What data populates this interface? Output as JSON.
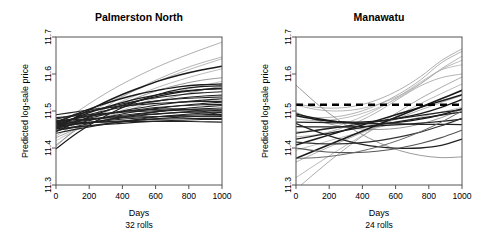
{
  "figure": {
    "kind": "two-panel-spaghetti-plot",
    "width": 479,
    "height": 245,
    "background": "#ffffff"
  },
  "chart_data": [
    {
      "type": "line",
      "panel_index": 0,
      "title": "Palmerston North",
      "xlabel": "Days",
      "sublabel": "32 rolls",
      "ylabel": "Predicted log-sale price",
      "xlim": [
        0,
        1000
      ],
      "ylim": [
        11.3,
        11.7
      ],
      "xticks": [
        0,
        200,
        400,
        600,
        800,
        1000
      ],
      "xticklabels": [
        "0",
        "200",
        "400",
        "600",
        "800",
        "1000"
      ],
      "yticks": [
        11.3,
        11.4,
        11.5,
        11.6,
        11.7
      ],
      "yticklabels": [
        "11.3",
        "11.4",
        "11.5",
        "11.6",
        "11.7"
      ],
      "grid": false,
      "legend": "none",
      "n_series": 32,
      "reference_line": null,
      "x": [
        0,
        125,
        250,
        375,
        500,
        625,
        750,
        875,
        1000
      ],
      "series": [
        {
          "name": "roll-01",
          "color": "#9a9a9a",
          "width": 0.8,
          "values": [
            11.455,
            11.497,
            11.534,
            11.567,
            11.596,
            11.622,
            11.645,
            11.666,
            11.686
          ]
        },
        {
          "name": "roll-02",
          "color": "#a5a5a5",
          "width": 0.8,
          "values": [
            11.447,
            11.479,
            11.508,
            11.535,
            11.56,
            11.583,
            11.604,
            11.623,
            11.641
          ]
        },
        {
          "name": "roll-03",
          "color": "#9f9f9f",
          "width": 0.8,
          "values": [
            11.404,
            11.454,
            11.496,
            11.532,
            11.562,
            11.588,
            11.611,
            11.63,
            11.646
          ]
        },
        {
          "name": "roll-04",
          "color": "#aaaaaa",
          "width": 0.8,
          "values": [
            11.432,
            11.466,
            11.496,
            11.522,
            11.545,
            11.566,
            11.584,
            11.6,
            11.614
          ]
        },
        {
          "name": "roll-05",
          "color": "#7d7d7d",
          "width": 0.8,
          "values": [
            11.408,
            11.45,
            11.485,
            11.514,
            11.538,
            11.557,
            11.572,
            11.583,
            11.59
          ]
        },
        {
          "name": "roll-06",
          "color": "#b4b4b4",
          "width": 0.8,
          "values": [
            11.42,
            11.449,
            11.475,
            11.498,
            11.519,
            11.538,
            11.554,
            11.568,
            11.58
          ]
        },
        {
          "name": "roll-07",
          "color": "#8f8f8f",
          "width": 0.8,
          "values": [
            11.428,
            11.452,
            11.474,
            11.494,
            11.512,
            11.528,
            11.543,
            11.556,
            11.567
          ]
        },
        {
          "name": "roll-08",
          "color": "#1a1a1a",
          "width": 1.5,
          "values": [
            11.452,
            11.485,
            11.514,
            11.54,
            11.562,
            11.582,
            11.598,
            11.611,
            11.621
          ]
        },
        {
          "name": "roll-09",
          "color": "#1a1a1a",
          "width": 1.4,
          "values": [
            11.468,
            11.492,
            11.513,
            11.531,
            11.546,
            11.557,
            11.566,
            11.571,
            11.573
          ]
        },
        {
          "name": "roll-10",
          "color": "#1a1a1a",
          "width": 1.3,
          "values": [
            11.46,
            11.483,
            11.503,
            11.52,
            11.534,
            11.545,
            11.553,
            11.558,
            11.56
          ]
        },
        {
          "name": "roll-11",
          "color": "#1a1a1a",
          "width": 1.3,
          "values": [
            11.444,
            11.47,
            11.492,
            11.512,
            11.528,
            11.541,
            11.551,
            11.558,
            11.562
          ]
        },
        {
          "name": "roll-12",
          "color": "#1a1a1a",
          "width": 1.2,
          "values": [
            11.398,
            11.44,
            11.475,
            11.504,
            11.528,
            11.546,
            11.559,
            11.566,
            11.568
          ]
        },
        {
          "name": "roll-13",
          "color": "#222222",
          "width": 1.1,
          "values": [
            11.472,
            11.489,
            11.504,
            11.517,
            11.528,
            11.537,
            11.544,
            11.549,
            11.552
          ]
        },
        {
          "name": "roll-14",
          "color": "#222222",
          "width": 1.1,
          "values": [
            11.466,
            11.482,
            11.496,
            11.508,
            11.519,
            11.528,
            11.535,
            11.54,
            11.543
          ]
        },
        {
          "name": "roll-15",
          "color": "#222222",
          "width": 1.1,
          "values": [
            11.478,
            11.491,
            11.503,
            11.513,
            11.521,
            11.528,
            11.533,
            11.536,
            11.538
          ]
        },
        {
          "name": "roll-16",
          "color": "#222222",
          "width": 1.1,
          "values": [
            11.458,
            11.473,
            11.486,
            11.498,
            11.508,
            11.517,
            11.524,
            11.529,
            11.533
          ]
        },
        {
          "name": "roll-17",
          "color": "#222222",
          "width": 1.1,
          "values": [
            11.49,
            11.498,
            11.506,
            11.512,
            11.517,
            11.521,
            11.524,
            11.526,
            11.526
          ]
        },
        {
          "name": "roll-18",
          "color": "#222222",
          "width": 1.1,
          "values": [
            11.452,
            11.466,
            11.479,
            11.49,
            11.5,
            11.508,
            11.515,
            11.52,
            11.524
          ]
        },
        {
          "name": "roll-19",
          "color": "#222222",
          "width": 1.1,
          "values": [
            11.47,
            11.48,
            11.489,
            11.497,
            11.504,
            11.51,
            11.514,
            11.517,
            11.518
          ]
        },
        {
          "name": "roll-20",
          "color": "#222222",
          "width": 1.1,
          "values": [
            11.446,
            11.459,
            11.471,
            11.482,
            11.491,
            11.499,
            11.506,
            11.511,
            11.515
          ]
        },
        {
          "name": "roll-21",
          "color": "#222222",
          "width": 1.1,
          "values": [
            11.462,
            11.471,
            11.479,
            11.487,
            11.493,
            11.499,
            11.503,
            11.506,
            11.508
          ]
        },
        {
          "name": "roll-22",
          "color": "#222222",
          "width": 1.1,
          "values": [
            11.482,
            11.487,
            11.492,
            11.496,
            11.499,
            11.501,
            11.503,
            11.503,
            11.503
          ]
        },
        {
          "name": "roll-23",
          "color": "#222222",
          "width": 1.1,
          "values": [
            11.455,
            11.464,
            11.473,
            11.48,
            11.487,
            11.492,
            11.497,
            11.5,
            11.502
          ]
        },
        {
          "name": "roll-24",
          "color": "#222222",
          "width": 1.1,
          "values": [
            11.468,
            11.474,
            11.48,
            11.485,
            11.489,
            11.493,
            11.496,
            11.497,
            11.498
          ]
        },
        {
          "name": "roll-25",
          "color": "#222222",
          "width": 1.1,
          "values": [
            11.44,
            11.451,
            11.461,
            11.47,
            11.478,
            11.485,
            11.49,
            11.494,
            11.496
          ]
        },
        {
          "name": "roll-26",
          "color": "#222222",
          "width": 1.1,
          "values": [
            11.458,
            11.465,
            11.471,
            11.477,
            11.481,
            11.485,
            11.488,
            11.49,
            11.491
          ]
        },
        {
          "name": "roll-27",
          "color": "#222222",
          "width": 1.1,
          "values": [
            11.474,
            11.477,
            11.48,
            11.482,
            11.484,
            11.485,
            11.486,
            11.486,
            11.485
          ]
        },
        {
          "name": "roll-28",
          "color": "#222222",
          "width": 1.1,
          "values": [
            11.448,
            11.456,
            11.463,
            11.47,
            11.475,
            11.48,
            11.483,
            11.486,
            11.487
          ]
        },
        {
          "name": "roll-29",
          "color": "#222222",
          "width": 1.1,
          "values": [
            11.462,
            11.466,
            11.47,
            11.473,
            11.476,
            11.478,
            11.479,
            11.48,
            11.48
          ]
        },
        {
          "name": "roll-30",
          "color": "#222222",
          "width": 1.1,
          "values": [
            11.452,
            11.457,
            11.462,
            11.466,
            11.47,
            11.473,
            11.475,
            11.477,
            11.477
          ]
        },
        {
          "name": "roll-31",
          "color": "#222222",
          "width": 1.2,
          "values": [
            11.466,
            11.468,
            11.47,
            11.471,
            11.472,
            11.472,
            11.472,
            11.471,
            11.47
          ]
        },
        {
          "name": "roll-32",
          "color": "#222222",
          "width": 1.2,
          "values": [
            11.47,
            11.481,
            11.49,
            11.497,
            11.502,
            11.505,
            11.505,
            11.5,
            11.488
          ]
        }
      ]
    },
    {
      "type": "line",
      "panel_index": 1,
      "title": "Manawatu",
      "xlabel": "Days",
      "sublabel": "24 rolls",
      "ylabel": "Predicted log-sale price",
      "xlim": [
        0,
        1000
      ],
      "ylim": [
        11.3,
        11.7
      ],
      "xticks": [
        0,
        200,
        400,
        600,
        800,
        1000
      ],
      "xticklabels": [
        "0",
        "200",
        "400",
        "600",
        "800",
        "1000"
      ],
      "yticks": [
        11.3,
        11.4,
        11.5,
        11.6,
        11.7
      ],
      "yticklabels": [
        "11.3",
        "11.4",
        "11.5",
        "11.6",
        "11.7"
      ],
      "grid": false,
      "legend": "none",
      "n_series": 24,
      "reference_line": {
        "name": "overall-mean",
        "value": 11.517,
        "style": "dashed",
        "color": "#000000",
        "width": 2.6
      },
      "x": [
        0,
        125,
        250,
        375,
        500,
        625,
        750,
        875,
        1000
      ],
      "series": [
        {
          "name": "roll-01",
          "color": "#9a9a9a",
          "width": 0.8,
          "values": [
            11.52,
            11.51,
            11.508,
            11.515,
            11.532,
            11.558,
            11.593,
            11.636,
            11.668
          ]
        },
        {
          "name": "roll-02",
          "color": "#a3a3a3",
          "width": 0.8,
          "values": [
            11.516,
            11.504,
            11.5,
            11.505,
            11.519,
            11.542,
            11.574,
            11.614,
            11.648
          ]
        },
        {
          "name": "roll-03",
          "color": "#9e9e9e",
          "width": 0.8,
          "values": [
            11.488,
            11.482,
            11.485,
            11.497,
            11.518,
            11.547,
            11.584,
            11.63,
            11.661
          ]
        },
        {
          "name": "roll-04",
          "color": "#ababab",
          "width": 0.8,
          "values": [
            11.478,
            11.474,
            11.478,
            11.49,
            11.51,
            11.538,
            11.573,
            11.612,
            11.637
          ]
        },
        {
          "name": "roll-05",
          "color": "#b0b0b0",
          "width": 0.8,
          "values": [
            11.444,
            11.448,
            11.46,
            11.48,
            11.507,
            11.541,
            11.578,
            11.611,
            11.625
          ]
        },
        {
          "name": "roll-06",
          "color": "#a0a0a0",
          "width": 0.8,
          "values": [
            11.43,
            11.436,
            11.45,
            11.471,
            11.5,
            11.535,
            11.568,
            11.59,
            11.6
          ]
        },
        {
          "name": "roll-07",
          "color": "#969696",
          "width": 0.8,
          "values": [
            11.288,
            11.336,
            11.382,
            11.424,
            11.464,
            11.5,
            11.534,
            11.564,
            11.592
          ]
        },
        {
          "name": "roll-08",
          "color": "#a8a8a8",
          "width": 0.8,
          "values": [
            11.32,
            11.357,
            11.393,
            11.427,
            11.459,
            11.49,
            11.52,
            11.547,
            11.573
          ]
        },
        {
          "name": "roll-09",
          "color": "#9c9c9c",
          "width": 0.8,
          "values": [
            11.362,
            11.388,
            11.413,
            11.437,
            11.46,
            11.482,
            11.503,
            11.523,
            11.542
          ]
        },
        {
          "name": "roll-10",
          "color": "#b2b2b2",
          "width": 0.8,
          "values": [
            11.394,
            11.41,
            11.426,
            11.441,
            11.456,
            11.47,
            11.484,
            11.497,
            11.51
          ]
        },
        {
          "name": "roll-11",
          "color": "#8a8a8a",
          "width": 0.9,
          "values": [
            11.496,
            11.475,
            11.46,
            11.452,
            11.45,
            11.454,
            11.465,
            11.482,
            11.505
          ]
        },
        {
          "name": "roll-12",
          "color": "#8f8f8f",
          "width": 0.9,
          "values": [
            11.57,
            11.52,
            11.477,
            11.442,
            11.414,
            11.393,
            11.38,
            11.374,
            11.376
          ]
        },
        {
          "name": "roll-13",
          "color": "#1a1a1a",
          "width": 1.6,
          "values": [
            11.372,
            11.395,
            11.418,
            11.441,
            11.464,
            11.487,
            11.51,
            11.533,
            11.556
          ]
        },
        {
          "name": "roll-14",
          "color": "#1a1a1a",
          "width": 1.5,
          "values": [
            11.408,
            11.425,
            11.442,
            11.459,
            11.476,
            11.493,
            11.51,
            11.527,
            11.544
          ]
        },
        {
          "name": "roll-15",
          "color": "#1a1a1a",
          "width": 1.4,
          "values": [
            11.487,
            11.477,
            11.471,
            11.47,
            11.473,
            11.481,
            11.493,
            11.51,
            11.531
          ]
        },
        {
          "name": "roll-16",
          "color": "#1a1a1a",
          "width": 1.4,
          "values": [
            11.492,
            11.48,
            11.471,
            11.467,
            11.466,
            11.47,
            11.478,
            11.49,
            11.506
          ]
        },
        {
          "name": "roll-17",
          "color": "#222222",
          "width": 1.3,
          "values": [
            11.44,
            11.448,
            11.456,
            11.464,
            11.472,
            11.48,
            11.488,
            11.496,
            11.504
          ]
        },
        {
          "name": "roll-18",
          "color": "#222222",
          "width": 1.3,
          "values": [
            11.424,
            11.434,
            11.444,
            11.454,
            11.463,
            11.472,
            11.481,
            11.489,
            11.497
          ]
        },
        {
          "name": "roll-19",
          "color": "#222222",
          "width": 1.2,
          "values": [
            11.47,
            11.469,
            11.468,
            11.467,
            11.466,
            11.465,
            11.464,
            11.464,
            11.463
          ]
        },
        {
          "name": "roll-20",
          "color": "#222222",
          "width": 1.2,
          "values": [
            11.458,
            11.457,
            11.457,
            11.458,
            11.46,
            11.463,
            11.467,
            11.472,
            11.478
          ]
        },
        {
          "name": "roll-21",
          "color": "#222222",
          "width": 1.3,
          "values": [
            11.466,
            11.444,
            11.426,
            11.412,
            11.403,
            11.399,
            11.4,
            11.407,
            11.424
          ]
        },
        {
          "name": "roll-22",
          "color": "#333333",
          "width": 1.2,
          "values": [
            11.416,
            11.412,
            11.411,
            11.414,
            11.42,
            11.43,
            11.443,
            11.46,
            11.48
          ]
        },
        {
          "name": "roll-23",
          "color": "#555555",
          "width": 1.1,
          "values": [
            11.4,
            11.392,
            11.388,
            11.388,
            11.392,
            11.4,
            11.412,
            11.428,
            11.448
          ]
        },
        {
          "name": "roll-24",
          "color": "#6a6a6a",
          "width": 1.0,
          "values": [
            11.372,
            11.374,
            11.38,
            11.39,
            11.404,
            11.422,
            11.444,
            11.47,
            11.5
          ]
        }
      ]
    }
  ]
}
